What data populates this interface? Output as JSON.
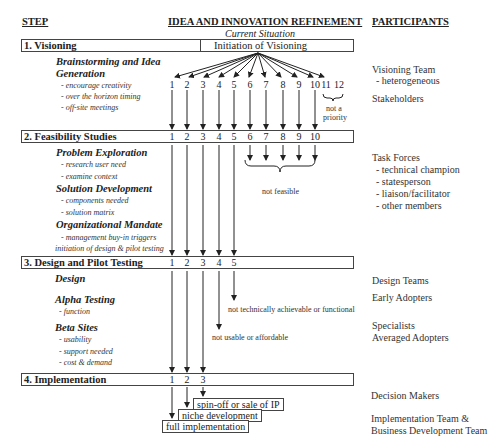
{
  "headers": {
    "step": "STEP",
    "refinement": "IDEA AND INNOVATION REFINEMENT",
    "participants": "PARTICIPANTS"
  },
  "current_situation": "Current Situation",
  "initiation": "Initiation of Visioning",
  "steps": [
    {
      "label": "1. Visioning",
      "subsections": [
        {
          "title": "Brainstorming and Idea",
          "title2": "Generation",
          "items": [
            "- encourage creativity",
            "- over the horizon timing",
            "- off-site meetings"
          ]
        }
      ],
      "numbers": [
        "1",
        "2",
        "3",
        "4",
        "5",
        "6",
        "7",
        "8",
        "9",
        "10",
        "11",
        "12"
      ],
      "dropped_note": [
        "not a",
        "priority"
      ]
    },
    {
      "label": "2. Feasibility Studies",
      "subsections": [
        {
          "title": "Problem Exploration",
          "items": [
            "- research user need",
            "- examine context"
          ]
        },
        {
          "title": "Solution Development",
          "items": [
            "- components needed",
            "- solution matrix"
          ]
        },
        {
          "title": "Organizational Mandate",
          "items": [
            "- management buy-in triggers",
            "initiation of design & pilot testing"
          ]
        }
      ],
      "numbers": [
        "1",
        "2",
        "3",
        "4",
        "5",
        "6",
        "7",
        "8",
        "9",
        "10"
      ],
      "dropped_note": "not feasible"
    },
    {
      "label": "3. Design and Pilot Testing",
      "subsections": [
        {
          "title": "Design",
          "items": []
        },
        {
          "title": "Alpha Testing",
          "items": [
            "- function"
          ]
        },
        {
          "title": "Beta Sites",
          "items": [
            "- usability",
            "- support needed",
            "- cost & demand"
          ]
        }
      ],
      "numbers": [
        "1",
        "2",
        "3",
        "4",
        "5"
      ],
      "dropped_notes": [
        "not technically achievable or functional",
        "not usable or affordable"
      ]
    },
    {
      "label": "4. Implementation",
      "numbers": [
        "1",
        "2",
        "3"
      ],
      "outcomes": [
        "spin-off or sale of IP",
        "niche development",
        "full implementation"
      ]
    }
  ],
  "participants": {
    "visioning_team": "Visioning Team",
    "visioning_team_sub": "- heterogeneous",
    "stakeholders": "Stakeholders",
    "task_forces": "Task Forces",
    "task_forces_items": [
      "- technical champion",
      "- statesperson",
      "- liaison/facilitator",
      "- other members"
    ],
    "design_teams": "Design Teams",
    "early_adopters": "Early Adopters",
    "specialists": "Specialists",
    "averaged_adopters": "Averaged Adopters",
    "decision_makers": "Decision Makers",
    "impl_team_1": "Implementation Team &",
    "impl_team_2": "Business Development Team"
  }
}
